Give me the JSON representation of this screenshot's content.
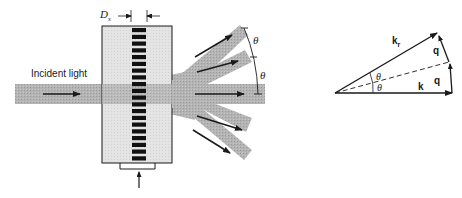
{
  "figure": {
    "left_panel": {
      "title": "Acousto-optic diffraction setup",
      "incident_label": "Incident light",
      "dimension_label": "D",
      "dimension_subscript": "s",
      "angle_labels": [
        "θ",
        "θ"
      ],
      "diffracted_orders": 5,
      "grating_bars": 20
    },
    "right_panel": {
      "title": "Wave-vector triangle",
      "vector_k": "k",
      "vector_kr": "k",
      "vector_kr_subscript": "r",
      "vector_q_upper": "q",
      "vector_q_lower": "q",
      "angle_upper": "θ",
      "angle_lower": "θ"
    },
    "colors": {
      "beam": "#b0b0b0",
      "cell_fill": "#e2e2e2",
      "grating": "#111111",
      "ink": "#1a1a1a"
    }
  }
}
